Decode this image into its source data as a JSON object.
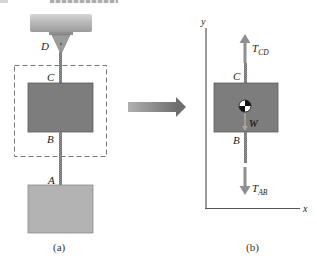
{
  "figure": {
    "panel_a": {
      "caption": "(a)",
      "labels": {
        "D": "D",
        "C": "C",
        "B": "B",
        "A": "A"
      },
      "elements": [
        "ceiling support",
        "hanger bracket at D",
        "cable CD",
        "upper block",
        "cable AB",
        "lower block",
        "dashed free-body boundary"
      ]
    },
    "transition_arrow": "arrow from (a) to (b)",
    "panel_b": {
      "caption": "(b)",
      "axes": {
        "x": "x",
        "y": "y"
      },
      "labels": {
        "C": "C",
        "B": "B"
      },
      "forces": {
        "upper": {
          "name": "T",
          "subscript": "CD",
          "direction": "up"
        },
        "lower": {
          "name": "T",
          "subscript": "AB",
          "direction": "down"
        },
        "weight": {
          "name": "W",
          "direction": "down"
        }
      },
      "symbols": [
        "center-of-gravity"
      ]
    },
    "colors": {
      "ceiling": "#a9a9a9",
      "upper_block": "#7d7d7d",
      "lower_block": "#b3b3b3",
      "cable": "#8c8c8c",
      "force_arrow": "#8f8f8f",
      "dashed_box": "#777777",
      "axes": "#555555",
      "transition_arrow": "#8a8a8a"
    }
  }
}
